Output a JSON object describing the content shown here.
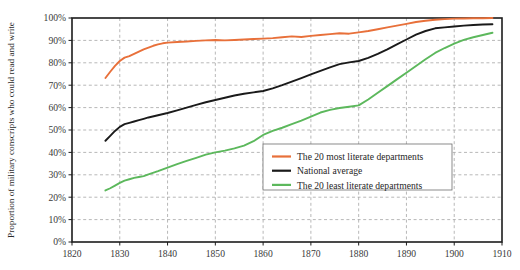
{
  "chart_data": {
    "type": "line",
    "title": "",
    "xlabel": "",
    "ylabel": "Proportion of military conscripts who could read and write",
    "xlim": [
      1820,
      1910
    ],
    "ylim": [
      0,
      100
    ],
    "grid": true,
    "legend_position": "center-right",
    "xticks": [
      1820,
      1830,
      1840,
      1850,
      1860,
      1870,
      1880,
      1890,
      1900,
      1910
    ],
    "xtick_labels": [
      "1820",
      "1830",
      "1840",
      "1850",
      "1860",
      "1870",
      "1880",
      "1890",
      "1900",
      "1910"
    ],
    "yticks": [
      0,
      10,
      20,
      30,
      40,
      50,
      60,
      70,
      80,
      90,
      100
    ],
    "ytick_labels": [
      "0%",
      "10%",
      "20%",
      "30%",
      "40%",
      "50%",
      "60%",
      "70%",
      "80%",
      "90%",
      "100%"
    ],
    "series": [
      {
        "name": "The 20 most literate departments",
        "color": "#E8703A",
        "x": [
          1827,
          1828,
          1829,
          1830,
          1831,
          1832,
          1833,
          1834,
          1835,
          1836,
          1837,
          1838,
          1839,
          1840,
          1842,
          1844,
          1846,
          1848,
          1850,
          1852,
          1854,
          1856,
          1858,
          1860,
          1862,
          1864,
          1866,
          1868,
          1870,
          1872,
          1874,
          1876,
          1878,
          1880,
          1882,
          1884,
          1886,
          1888,
          1890,
          1892,
          1894,
          1896,
          1898,
          1900,
          1902,
          1904,
          1906,
          1908
        ],
        "values": [
          73.2,
          76.0,
          78.6,
          80.8,
          82.3,
          83.0,
          84.0,
          85.0,
          86.0,
          86.8,
          87.6,
          88.2,
          88.7,
          89.0,
          89.3,
          89.5,
          89.8,
          90.0,
          90.2,
          90.0,
          90.2,
          90.4,
          90.6,
          90.8,
          91.0,
          91.4,
          91.8,
          91.5,
          92.0,
          92.4,
          92.8,
          93.2,
          93.0,
          93.6,
          94.2,
          95.0,
          95.8,
          96.6,
          97.4,
          98.2,
          98.8,
          99.2,
          99.5,
          99.7,
          99.8,
          99.9,
          99.9,
          100.0
        ]
      },
      {
        "name": "National average",
        "color": "#1A1A1A",
        "x": [
          1827,
          1828,
          1829,
          1830,
          1831,
          1832,
          1833,
          1834,
          1835,
          1836,
          1838,
          1840,
          1842,
          1844,
          1846,
          1848,
          1850,
          1852,
          1854,
          1856,
          1858,
          1860,
          1862,
          1864,
          1866,
          1868,
          1870,
          1872,
          1874,
          1876,
          1878,
          1880,
          1882,
          1884,
          1886,
          1888,
          1890,
          1892,
          1894,
          1896,
          1898,
          1900,
          1902,
          1904,
          1906,
          1908
        ],
        "values": [
          45.2,
          47.4,
          49.6,
          51.4,
          52.6,
          53.2,
          53.8,
          54.4,
          55.0,
          55.6,
          56.6,
          57.6,
          58.8,
          60.0,
          61.2,
          62.4,
          63.4,
          64.4,
          65.4,
          66.2,
          66.8,
          67.4,
          68.6,
          70.0,
          71.6,
          73.2,
          74.8,
          76.4,
          78.0,
          79.4,
          80.2,
          80.8,
          82.2,
          84.0,
          86.0,
          88.2,
          90.4,
          92.6,
          94.2,
          95.4,
          95.8,
          96.2,
          96.6,
          96.9,
          97.1,
          97.2
        ]
      },
      {
        "name": "The 20 least literate departments",
        "color": "#5CB85C",
        "x": [
          1827,
          1828,
          1829,
          1830,
          1831,
          1832,
          1833,
          1834,
          1835,
          1836,
          1838,
          1840,
          1842,
          1844,
          1846,
          1848,
          1850,
          1852,
          1854,
          1856,
          1858,
          1860,
          1862,
          1864,
          1866,
          1868,
          1870,
          1872,
          1874,
          1876,
          1878,
          1880,
          1882,
          1884,
          1886,
          1888,
          1890,
          1892,
          1894,
          1896,
          1898,
          1900,
          1902,
          1904,
          1906,
          1908
        ],
        "values": [
          23.0,
          24.0,
          25.2,
          26.4,
          27.4,
          28.0,
          28.6,
          29.0,
          29.4,
          30.2,
          31.6,
          33.2,
          34.8,
          36.2,
          37.6,
          39.0,
          40.0,
          40.8,
          41.8,
          43.0,
          45.0,
          47.8,
          49.6,
          51.0,
          52.6,
          54.2,
          56.0,
          57.8,
          59.0,
          59.8,
          60.4,
          61.0,
          63.6,
          66.6,
          69.6,
          72.6,
          75.6,
          78.6,
          81.6,
          84.4,
          86.6,
          88.6,
          90.2,
          91.4,
          92.4,
          93.4
        ]
      }
    ]
  },
  "legend": {
    "entries": [
      {
        "label": "The 20 most literate departments",
        "color": "#E8703A"
      },
      {
        "label": "National average",
        "color": "#1A1A1A"
      },
      {
        "label": "The 20 least literate departments",
        "color": "#5CB85C"
      }
    ]
  }
}
